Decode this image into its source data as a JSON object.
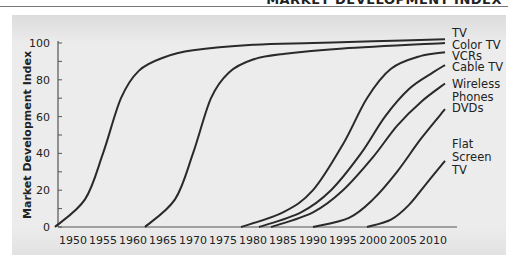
{
  "header": {
    "text": "MARKET DEVELOPMENT INDEX"
  },
  "chart_data": {
    "type": "line",
    "title": "",
    "xlabel": "",
    "ylabel": "Market Development Index",
    "ylim": [
      0,
      100
    ],
    "xlim": [
      1947,
      2012
    ],
    "yticks": [
      0,
      20,
      40,
      60,
      80,
      100
    ],
    "xticks": [
      1950,
      1955,
      1960,
      1965,
      1970,
      1975,
      1980,
      1985,
      1990,
      1995,
      2000,
      2005,
      2010
    ],
    "grid": false,
    "legend_position": "right-inline",
    "series": [
      {
        "name": "TV",
        "label_lines": [
          "TV"
        ],
        "x": [
          1947,
          1952,
          1955,
          1958,
          1961,
          1965,
          1970,
          1980,
          1990,
          2000,
          2012
        ],
        "values": [
          0,
          15,
          40,
          70,
          85,
          92,
          96,
          99,
          100,
          101,
          102
        ]
      },
      {
        "name": "Color TV",
        "label_lines": [
          "Color TV"
        ],
        "x": [
          1962,
          1967,
          1970,
          1973,
          1976,
          1980,
          1985,
          1995,
          2012
        ],
        "values": [
          0,
          15,
          40,
          70,
          84,
          91,
          94,
          97,
          100
        ]
      },
      {
        "name": "VCRs",
        "label_lines": [
          "VCRs"
        ],
        "x": [
          1978,
          1985,
          1990,
          1995,
          1999,
          2003,
          2008,
          2012
        ],
        "values": [
          0,
          8,
          20,
          45,
          70,
          86,
          93,
          95
        ]
      },
      {
        "name": "Cable TV",
        "label_lines": [
          "Cable TV"
        ],
        "x": [
          1981,
          1988,
          1993,
          1998,
          2002,
          2006,
          2010,
          2012
        ],
        "values": [
          0,
          8,
          20,
          40,
          60,
          75,
          84,
          88
        ]
      },
      {
        "name": "Wireless Phones",
        "label_lines": [
          "Wireless",
          "Phones"
        ],
        "x": [
          1983,
          1990,
          1995,
          2000,
          2004,
          2008,
          2012
        ],
        "values": [
          0,
          8,
          20,
          38,
          55,
          68,
          78
        ]
      },
      {
        "name": "DVDs",
        "label_lines": [
          "DVDs"
        ],
        "x": [
          1990,
          1996,
          2000,
          2004,
          2008,
          2012
        ],
        "values": [
          0,
          5,
          15,
          30,
          48,
          64
        ]
      },
      {
        "name": "Flat Screen TV",
        "label_lines": [
          "Flat",
          "Screen",
          "TV"
        ],
        "x": [
          1999,
          2003,
          2006,
          2009,
          2012
        ],
        "values": [
          0,
          4,
          12,
          24,
          36
        ]
      }
    ]
  }
}
